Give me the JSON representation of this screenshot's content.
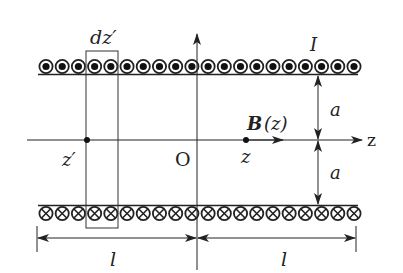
{
  "diagram": {
    "labels": {
      "element_width": "dz′",
      "current": "I",
      "field_bold": "B",
      "field_arg": "(z)",
      "radius_top": "a",
      "radius_bottom": "a",
      "axis": "z",
      "origin": "O",
      "source_point": "z′",
      "field_point": "z",
      "half_length_left": "l",
      "half_length_right": "l"
    },
    "coils": {
      "top_symbol": "current-out-of-page",
      "bottom_symbol": "current-into-page",
      "count_per_row": 20
    },
    "colors": {
      "line": "#222222",
      "background": "#ffffff"
    }
  }
}
